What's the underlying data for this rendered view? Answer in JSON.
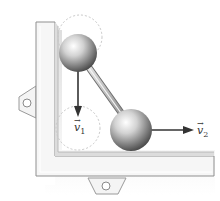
{
  "figure": {
    "labels": {
      "v1": {
        "symbol": "v",
        "subscript": "1",
        "arrow": "→"
      },
      "v2": {
        "symbol": "v",
        "subscript": "2",
        "arrow": "→"
      }
    },
    "colors": {
      "frame_face": "#f4f4f4",
      "frame_edge": "#9a9a9a",
      "frame_inner": "#e2e2e2",
      "shadow": "#cfcfcf",
      "ball_light": "#ffffff",
      "ball_dark": "#3c3c3c",
      "rod": "#bdbdbd",
      "arrow": "#333333",
      "ghost_circle": "#c8c8c8"
    }
  }
}
